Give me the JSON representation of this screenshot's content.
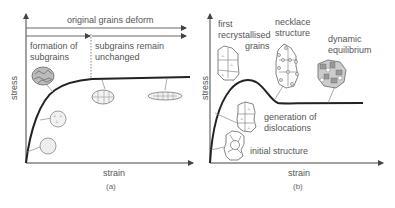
{
  "panel_a": {
    "caption": "(a)",
    "xlabel": "strain",
    "ylabel": "stress",
    "top_span_label": "original grains deform",
    "region_1_label_line1": "formation of",
    "region_1_label_line2": "subgrains",
    "region_2_label_line1": "subgrains remain",
    "region_2_label_line2": "unchanged",
    "curve_type": "work hardening to steady-state plateau",
    "grain_icons": [
      "initial-grain",
      "dislocation-grain",
      "dense-subgrain-grain",
      "elongated-subgrain-grain",
      "flattened-subgrain-grain"
    ]
  },
  "panel_b": {
    "caption": "(b)",
    "xlabel": "strain",
    "ylabel": "stress",
    "label_first_line1": "first",
    "label_first_line2": "recrystallised",
    "label_first_line3": "grains",
    "label_necklace_line1": "necklace",
    "label_necklace_line2": "structure",
    "label_dynamic_line1": "dynamic",
    "label_dynamic_line2": "equilibrium",
    "label_generation_line1": "generation of",
    "label_generation_line2": "dislocations",
    "label_initial": "initial structure",
    "curve_type": "single peak then steady-state",
    "grain_icons": [
      "initial-structure-cluster",
      "dislocation-cluster",
      "first-recrystallised-cluster",
      "necklace-cluster",
      "dynamic-equilibrium-cluster"
    ]
  },
  "colors": {
    "curve": "#222222",
    "axis": "#444444",
    "grain_outline": "#777777",
    "text": "#555555"
  }
}
